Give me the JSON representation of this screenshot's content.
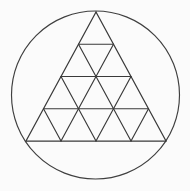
{
  "figure": {
    "canvas": {
      "width": 190,
      "height": 191,
      "background_color": "#fbfbfb"
    },
    "colors": {
      "stroke": "#3a3a3a",
      "circle_stroke": "#3f3f3f",
      "background": "#fbfbfb"
    },
    "stroke_widths": {
      "circle": 1.15,
      "triangle_edge": 1.25,
      "grid_line": 1.15
    },
    "circle": {
      "label": "circumscribed circle",
      "center_x": 95.5,
      "center_y": 95.0,
      "radius": 84.0,
      "left_x": 11.5,
      "right_x": 179.5,
      "top_y": 11.0,
      "bottom_y": 179.0
    },
    "triangle": {
      "label": "inscribed equilateral triangle",
      "subdivision_rows": 4,
      "small_triangle_count": 16,
      "upward_small_triangles": 10,
      "downward_small_triangles": 6,
      "apex": {
        "x": 96.0,
        "y": 12.0
      },
      "base_left": {
        "x": 26.0,
        "y": 141.0
      },
      "base_right": {
        "x": 166.0,
        "y": 141.0
      },
      "side_length": 140.0,
      "height": 129.0,
      "cell_size": 35.0,
      "row_y_positions": [
        12.0,
        44.25,
        76.5,
        108.75,
        141.0
      ],
      "rows": [
        {
          "index": 0,
          "y": 12.0,
          "left_x": 96.0,
          "right_x": 96.0,
          "cells": 0
        },
        {
          "index": 1,
          "y": 44.25,
          "left_x": 78.5,
          "right_x": 113.5,
          "cells": 1
        },
        {
          "index": 2,
          "y": 76.5,
          "left_x": 61.0,
          "right_x": 131.0,
          "cells": 2
        },
        {
          "index": 3,
          "y": 108.75,
          "left_x": 43.5,
          "right_x": 148.5,
          "cells": 3
        },
        {
          "index": 4,
          "y": 141.0,
          "left_x": 26.0,
          "right_x": 166.0,
          "cells": 4
        }
      ],
      "horizontal_lines": [
        {
          "name": "row-1-horizontal",
          "x1": 78.5,
          "y1": 44.25,
          "x2": 113.5,
          "y2": 44.25
        },
        {
          "name": "row-2-horizontal",
          "x1": 61.0,
          "y1": 76.5,
          "x2": 131.0,
          "y2": 76.5
        },
        {
          "name": "row-3-horizontal",
          "x1": 43.5,
          "y1": 108.75,
          "x2": 148.5,
          "y2": 108.75
        },
        {
          "name": "base-horizontal",
          "x1": 26.0,
          "y1": 141.0,
          "x2": 166.0,
          "y2": 141.0
        }
      ],
      "left_leaning_lines": [
        {
          "name": "left-edge",
          "x1": 96.0,
          "y1": 12.0,
          "x2": 26.0,
          "y2": 141.0
        },
        {
          "name": "left-lean-1",
          "x1": 113.5,
          "y1": 44.25,
          "x2": 61.0,
          "y2": 141.0
        },
        {
          "name": "left-lean-2",
          "x1": 131.0,
          "y1": 76.5,
          "x2": 96.0,
          "y2": 141.0
        },
        {
          "name": "left-lean-3",
          "x1": 148.5,
          "y1": 108.75,
          "x2": 131.0,
          "y2": 141.0
        }
      ],
      "right_leaning_lines": [
        {
          "name": "right-edge",
          "x1": 96.0,
          "y1": 12.0,
          "x2": 166.0,
          "y2": 141.0
        },
        {
          "name": "right-lean-1",
          "x1": 78.5,
          "y1": 44.25,
          "x2": 131.0,
          "y2": 141.0
        },
        {
          "name": "right-lean-2",
          "x1": 61.0,
          "y1": 76.5,
          "x2": 96.0,
          "y2": 141.0
        },
        {
          "name": "right-lean-3",
          "x1": 43.5,
          "y1": 108.75,
          "x2": 61.0,
          "y2": 141.0
        }
      ]
    }
  }
}
